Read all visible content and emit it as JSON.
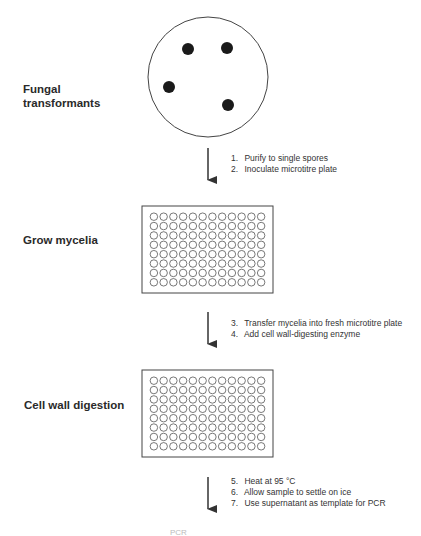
{
  "diagram": {
    "stages": [
      {
        "id": "fungal-transformants",
        "label_line1": "Fungal",
        "label_line2": "transformants",
        "shape": "petri-dish",
        "colonies": 4
      },
      {
        "id": "grow-mycelia",
        "label": "Grow mycelia",
        "shape": "microtitre-plate",
        "rows": 8,
        "cols": 12
      },
      {
        "id": "cell-wall-digestion",
        "label": "Cell wall digestion",
        "shape": "microtitre-plate",
        "rows": 8,
        "cols": 12
      },
      {
        "id": "pcr",
        "label": "PCR",
        "shape": "text-cutoff"
      }
    ],
    "transitions": [
      {
        "from": "fungal-transformants",
        "to": "grow-mycelia",
        "steps": [
          {
            "num": "1.",
            "text": "Purify to single spores"
          },
          {
            "num": "2.",
            "text": "Inoculate microtitre plate"
          }
        ]
      },
      {
        "from": "grow-mycelia",
        "to": "cell-wall-digestion",
        "steps": [
          {
            "num": "3.",
            "text": "Transfer mycelia into fresh microtitre plate"
          },
          {
            "num": "4.",
            "text": "Add cell wall-digesting enzyme"
          }
        ]
      },
      {
        "from": "cell-wall-digestion",
        "to": "pcr",
        "steps": [
          {
            "num": "5.",
            "text": "Heat at 95 °C"
          },
          {
            "num": "6.",
            "text": "Allow sample to settle on ice"
          },
          {
            "num": "7.",
            "text": "Use supernatant as template for PCR"
          }
        ]
      }
    ],
    "colors": {
      "line": "#333333",
      "colony": "#1a1a1a",
      "background": "#ffffff"
    }
  }
}
